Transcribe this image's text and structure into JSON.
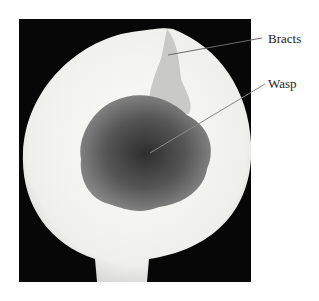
{
  "figure": {
    "labels": [
      {
        "text": "Bracts"
      },
      {
        "text": "Wasp"
      }
    ],
    "colors": {
      "background": "#070707",
      "flesh": "#f2f2f0",
      "florets": "#6e6e6e",
      "leader": "#555555"
    }
  }
}
